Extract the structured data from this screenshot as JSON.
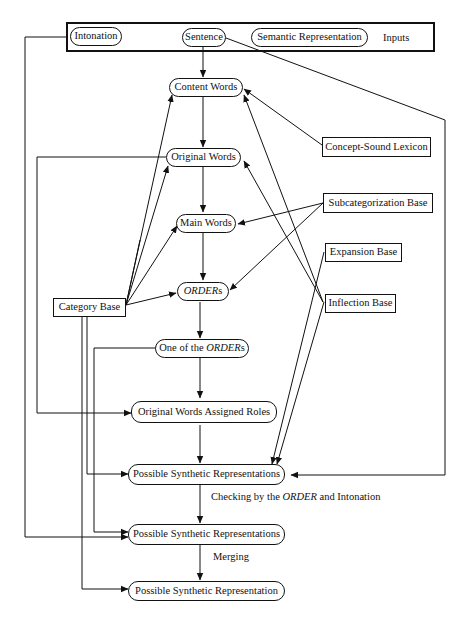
{
  "inputs": {
    "label": "Inputs",
    "intonation": "Intonation",
    "sentence": "Sentence",
    "semantic_representation": "Semantic Representation"
  },
  "process_nodes": {
    "content_words": "Content Words",
    "original_words": "Original Words",
    "main_words": "Main Words",
    "orders_italic": "ORDER",
    "orders_suffix": "s",
    "one_of_prefix": "One of the ",
    "one_of_italic": "ORDER",
    "one_of_suffix": "s",
    "original_words_assigned_roles": "Original Words Assigned Roles",
    "possible_synthetic_representations_1": "Possible Synthetic Representations",
    "possible_synthetic_representations_2": "Possible Synthetic Representations",
    "possible_synthetic_representation": "Possible Synthetic Representation"
  },
  "knowledge_bases": {
    "concept_sound_lexicon": "Concept-Sound Lexicon",
    "subcategorization_base": "Subcategorization Base",
    "expansion_base": "Expansion Base",
    "inflection_base": "Inflection Base",
    "category_base": "Category Base"
  },
  "edge_labels": {
    "checking_prefix": "Checking by the ",
    "checking_italic": "ORDER",
    "checking_suffix": " and Intonation",
    "merging": "Merging"
  },
  "colors": {
    "line": "#111111",
    "background": "#ffffff"
  }
}
